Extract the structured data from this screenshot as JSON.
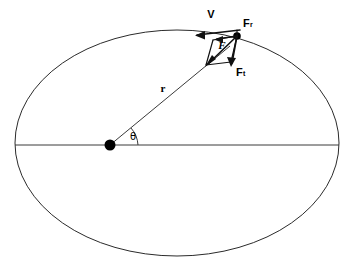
{
  "figure": {
    "kind": "orbital-force-decomposition-diagram",
    "background_color": "#ffffff",
    "line_color": "#2b2b2b",
    "vector_color": "#111111",
    "width": 354,
    "height": 271
  },
  "labels": {
    "velocity": "V",
    "force_resultant": "F",
    "force_component_upper": "F",
    "force_component_upper_sub": "r",
    "force_component_lower": "F",
    "force_component_lower_sub": "t",
    "radius": "r",
    "angle": "θ"
  },
  "geometry": {
    "ellipse": {
      "center_x": 177,
      "center_y": 143,
      "radius_x": 162,
      "radius_y": 113
    },
    "focus_dot": {
      "x": 110,
      "y": 145,
      "radius": 5
    },
    "orbit_point": {
      "x": 237,
      "y": 36,
      "radius": 3.6
    },
    "major_axis": {
      "x1": 15,
      "y1": 145,
      "x2": 339,
      "y2": 145
    },
    "radius_line": {
      "x1": 110,
      "y1": 145,
      "x2": 228,
      "y2": 48
    },
    "angle_arc_degrees": 39
  },
  "vectors": {
    "velocity": {
      "name": "V",
      "from_x": 237,
      "from_y": 30,
      "to_x": 196,
      "to_y": 34,
      "description": "tangential velocity pointing back along the orbit"
    },
    "resultant": {
      "name": "F",
      "from_x": 237,
      "from_y": 36,
      "to_x": 208,
      "to_y": 63,
      "description": "resultant force toward the focus"
    },
    "component_radial": {
      "name": "Fr",
      "from_x": 237,
      "from_y": 36,
      "to_x": 219,
      "to_y": 39,
      "description": "component along the velocity direction"
    },
    "component_tangential": {
      "name": "Ft",
      "from_x": 237,
      "from_y": 36,
      "to_x": 233,
      "to_y": 66,
      "description": "component perpendicular to the velocity"
    }
  },
  "label_positions": {
    "velocity": {
      "x": 213,
      "y": 14
    },
    "resultant": {
      "x": 223,
      "y": 45
    },
    "upper_component": {
      "x": 244,
      "y": 24
    },
    "lower_component": {
      "x": 238,
      "y": 73
    },
    "radius": {
      "x": 163,
      "y": 88
    },
    "angle": {
      "x": 132,
      "y": 136
    }
  }
}
